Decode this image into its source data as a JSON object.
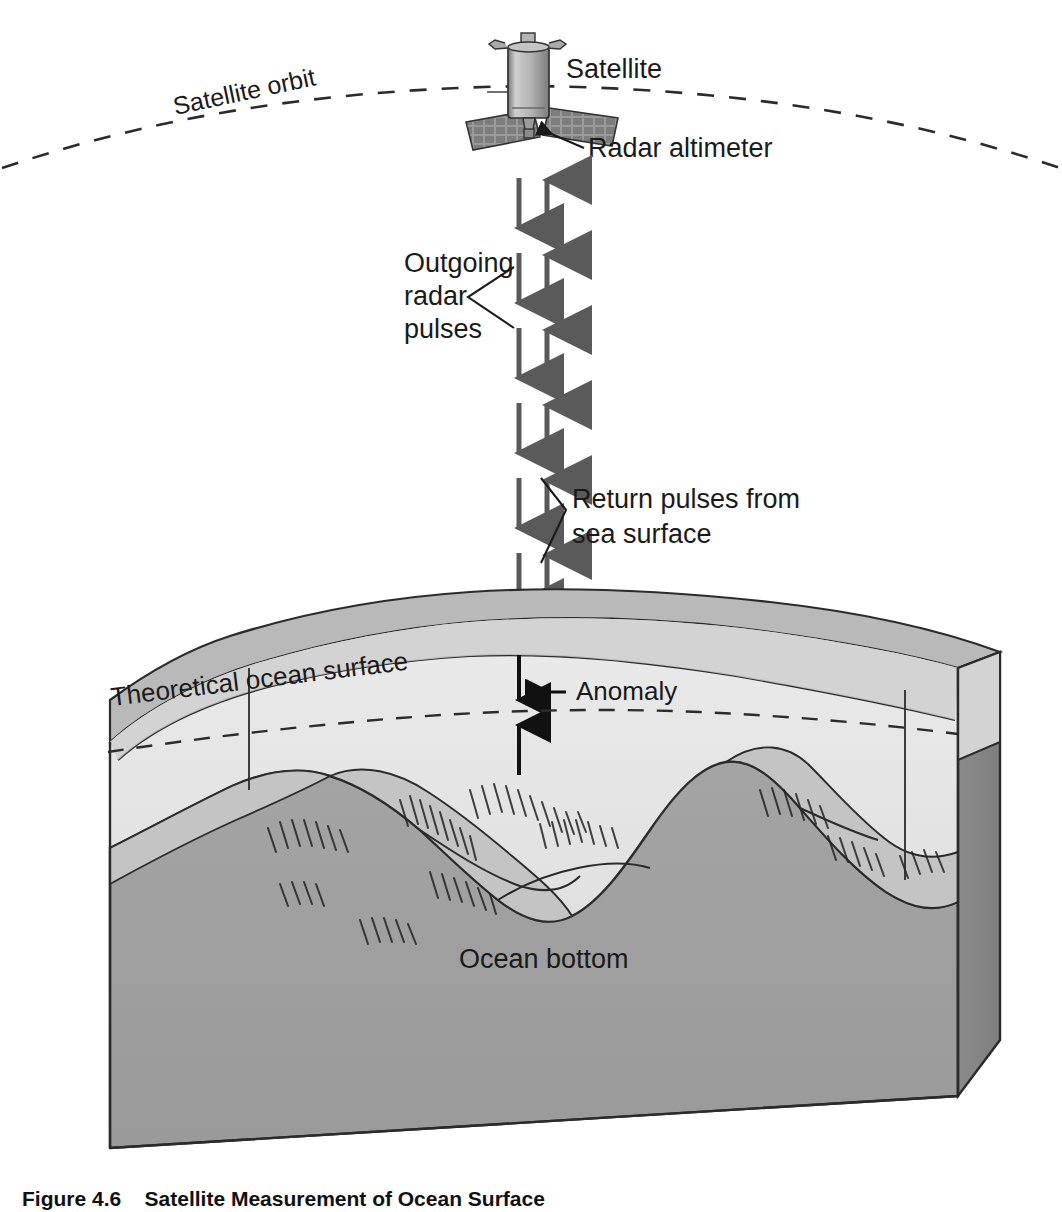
{
  "figure": {
    "title": "Satellite Measurement of Ocean Surface",
    "caption_number": "Figure 4.6",
    "caption_text": "Satellite Measurement of Ocean Surface"
  },
  "labels": {
    "satellite": "Satellite",
    "satellite_orbit": "Satellite orbit",
    "radar_altimeter": "Radar altimeter",
    "outgoing_line1": "Outgoing",
    "outgoing_line2": "radar",
    "outgoing_line3": "pulses",
    "return_line1": "Return pulses from",
    "return_line2": "sea surface",
    "theoretical_ocean_surface": "Theoretical ocean surface",
    "anomaly": "Anomaly",
    "ocean_bottom": "Ocean bottom"
  },
  "colors": {
    "ink": "#1a1a1a",
    "outline": "#2b2b2b",
    "pulse_arrow": "#5a5a5a",
    "measure_arrow": "#111111",
    "water_light": "#e8e8e8",
    "water_band": "#b9b9b9",
    "water_face": "#dcdcdc",
    "rock_light": "#c9c9c9",
    "rock_mid": "#a8a8a8",
    "rock_dark": "#8f8f8f",
    "rock_face": "#9a9a9a",
    "satellite_body": "#b0b0b0",
    "panel": "#8d8d8d",
    "background": "#ffffff"
  },
  "diagram": {
    "type": "cutaway-block-perspective",
    "orbit_style": "dashed-arc",
    "pulse_columns": [
      {
        "name": "outgoing",
        "direction": "down",
        "count": 7
      },
      {
        "name": "return",
        "direction": "up",
        "count": 7
      }
    ],
    "anomaly_arrows": [
      {
        "name": "anomaly-down-arrow",
        "direction": "down"
      },
      {
        "name": "anomaly-up-arrow",
        "direction": "up"
      }
    ]
  }
}
